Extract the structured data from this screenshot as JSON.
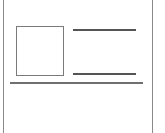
{
  "wireframe": {
    "description": "card wireframe sketch",
    "elements": [
      {
        "type": "frame",
        "sides": [
          "left",
          "right"
        ]
      },
      {
        "type": "image-placeholder"
      },
      {
        "type": "text-line",
        "position": "top"
      },
      {
        "type": "text-line",
        "position": "bottom"
      },
      {
        "type": "divider"
      }
    ]
  },
  "colors": {
    "frame": "#8a8a8a",
    "box": "#7a7a7a",
    "lines": "#555555",
    "divider": "#707070",
    "background": "#ffffff"
  }
}
